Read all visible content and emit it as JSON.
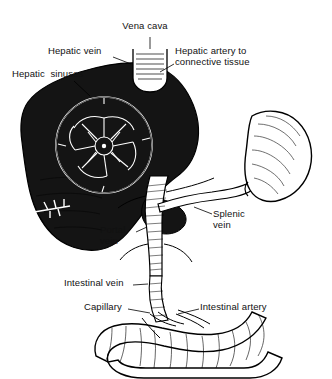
{
  "figure": {
    "kind": "line-drawing",
    "colors": {
      "ink": "#111111",
      "liver_fill": "#1a1a1a",
      "background": "#ffffff",
      "vessel_fill": "#ffffff"
    },
    "labels": [
      {
        "id": "vena-cava",
        "text": "Vena cava",
        "x": 127,
        "y": 26,
        "align": "center"
      },
      {
        "id": "hepatic-vein",
        "text": "Hepatic vein",
        "x": 48,
        "y": 51,
        "align": "left"
      },
      {
        "id": "hepatic-artery",
        "text": "Hepatic artery to\nconnective tissue",
        "x": 175,
        "y": 51,
        "align": "left"
      },
      {
        "id": "hepatic-sinuses",
        "text": "Hepatic  sinuses",
        "x": 14,
        "y": 73,
        "align": "left"
      },
      {
        "id": "splenic-vein",
        "text": "Splenic\nvein",
        "x": 213,
        "y": 212,
        "align": "left"
      },
      {
        "id": "portal-vein",
        "text": "Portal\nvein",
        "x": 102,
        "y": 228,
        "align": "left"
      },
      {
        "id": "intestinal-vein",
        "text": "Intestinal vein",
        "x": 66,
        "y": 281,
        "align": "left"
      },
      {
        "id": "capillary",
        "text": "Capillary",
        "x": 86,
        "y": 305,
        "align": "left"
      },
      {
        "id": "intestinal-artery",
        "text": "Intestinal artery",
        "x": 200,
        "y": 305,
        "align": "left"
      }
    ],
    "leaders": [
      {
        "id": "leader-vena-cava",
        "d": "M150 37 L150 49"
      },
      {
        "id": "leader-hepatic-vein",
        "d": "M113 57 L128 62"
      },
      {
        "id": "leader-hepatic-artery",
        "d": "M174 62 L162 68"
      },
      {
        "id": "leader-hepatic-sinuses",
        "d": "M72 80 L86 92"
      },
      {
        "id": "leader-splenic-vein",
        "d": "M212 214 L196 208"
      },
      {
        "id": "leader-portal-vein",
        "d": "M134 232 L146 226"
      },
      {
        "id": "leader-intestinal-vein",
        "d": "M131 285 L148 283"
      },
      {
        "id": "leader-capillary",
        "d": "M126 309 L150 312"
      },
      {
        "id": "leader-intestinal-artery",
        "d": "M199 309 L176 314"
      }
    ]
  }
}
